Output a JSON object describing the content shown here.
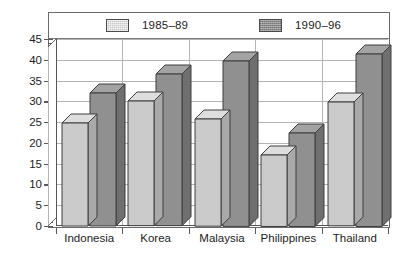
{
  "chart_data": {
    "type": "bar",
    "title": "",
    "subtitle": "",
    "xlabel": "",
    "ylabel": "",
    "categories": [
      "Indonesia",
      "Korea",
      "Malaysia",
      "Philippines",
      "Thailand"
    ],
    "series": [
      {
        "name": "1985‒89",
        "color": "#cbcbcb",
        "values": [
          24.8,
          30.0,
          25.8,
          17.2,
          29.8
        ]
      },
      {
        "name": "1990‒96",
        "color": "#909090",
        "values": [
          32.0,
          36.5,
          39.8,
          22.5,
          41.5
        ]
      }
    ],
    "ylim": [
      0,
      45
    ],
    "ytick_step": 5,
    "yminor_step": 1,
    "ytick_labels": [
      "0",
      "5",
      "10",
      "15",
      "20",
      "25",
      "30",
      "35",
      "40",
      "45"
    ],
    "ytick_values": [
      0,
      5,
      10,
      15,
      20,
      25,
      30,
      35,
      40,
      45
    ],
    "grid": true,
    "grid_axis": "y",
    "legend_position": "top",
    "style": "3d-bar",
    "frame": true
  },
  "legend": {
    "items": [
      {
        "label": "1985‒89",
        "swatch": "light-gray-swatch"
      },
      {
        "label": "1990‒96",
        "swatch": "dark-gray-swatch"
      }
    ]
  },
  "colors": {
    "series_light": "#cbcbcb",
    "series_dark": "#909090",
    "grid": "#b4b4b4",
    "axis": "#555555",
    "frame": "#6a6a6a",
    "text": "#1d1d1d",
    "background": "#ffffff"
  }
}
